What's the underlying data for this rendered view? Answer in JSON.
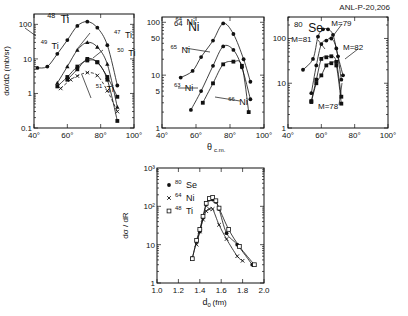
{
  "figure_ref": "ANL-P-20,206",
  "chart_data": [
    {
      "id": "ti",
      "type": "line",
      "scale_y": "log",
      "title": "48Ti",
      "panel_label": {
        "mass": "48",
        "symbol": "Ti"
      },
      "xlabel": "",
      "ylabel": "dσ/dΩ (mb/sr)",
      "xlim": [
        40,
        100
      ],
      "ylim": [
        0.1,
        200
      ],
      "x_ticks": [
        "40°",
        "60°",
        "80°",
        "100°"
      ],
      "y_ticks": [
        "100",
        "10",
        "1",
        "0.1"
      ],
      "series": [
        {
          "name": "48Ti",
          "marker": "filled-circle",
          "x": [
            42,
            48,
            54,
            60,
            66,
            72,
            78,
            84,
            90
          ],
          "y": [
            5.5,
            6,
            14,
            35,
            90,
            120,
            80,
            25,
            1.7
          ]
        },
        {
          "name": "49Ti",
          "marker": "filled-triangle",
          "x": [
            54,
            60,
            66,
            72,
            78,
            84,
            90
          ],
          "y": [
            2,
            6,
            18,
            30,
            22,
            7,
            0.4
          ]
        },
        {
          "name": "47Ti",
          "marker": "filled-square",
          "x": [
            54,
            60,
            66,
            72,
            78,
            84,
            90
          ],
          "y": [
            1.6,
            3,
            6,
            9,
            8,
            2.5,
            0.16
          ]
        },
        {
          "name": "50Ti",
          "marker": "filled-square",
          "x": [
            60,
            66,
            72,
            78,
            84,
            90
          ],
          "y": [
            2.5,
            5,
            10,
            8,
            3,
            0.8
          ]
        },
        {
          "name": "51Ti",
          "marker": "cross",
          "x": [
            56,
            62,
            66,
            72,
            78,
            84,
            90
          ],
          "y": [
            1.4,
            2.5,
            3.2,
            4,
            3.3,
            1.2,
            0.3
          ]
        }
      ],
      "annotations": [
        {
          "text": "48",
          "sub": "Ti",
          "at": [
            48,
            110
          ]
        },
        {
          "text": "49",
          "sub": "Ti",
          "at": [
            44,
            20
          ]
        },
        {
          "text": "47",
          "sub": "Ti",
          "at": [
            88,
            40
          ]
        },
        {
          "text": "50",
          "sub": "Ti",
          "at": [
            90,
            12
          ]
        },
        {
          "text": "51",
          "sub": "Ti",
          "at": [
            77,
            1.1
          ]
        }
      ]
    },
    {
      "id": "ni",
      "type": "line",
      "scale_y": "log",
      "title": "64Ni",
      "panel_label": {
        "mass": "64",
        "symbol": "Ni"
      },
      "xlabel": "θc.m.",
      "ylabel": "",
      "xlim": [
        40,
        100
      ],
      "ylim": [
        1,
        120
      ],
      "x_ticks": [
        "40°",
        "60°",
        "80°",
        "100°"
      ],
      "y_ticks": [
        "100",
        "50",
        "10",
        "5",
        "1"
      ],
      "series": [
        {
          "name": "64Ni",
          "marker": "filled-circle",
          "x": [
            51,
            58,
            63,
            70,
            76,
            82,
            88,
            92
          ],
          "y": [
            9,
            12,
            22,
            45,
            95,
            60,
            20,
            7.5
          ]
        },
        {
          "name": "65Ni",
          "marker": "filled-circle",
          "x": [
            57,
            63,
            70,
            76,
            82,
            87,
            92
          ],
          "y": [
            2.2,
            5,
            15,
            35,
            30,
            14,
            3.5
          ]
        },
        {
          "name": "66Ni",
          "marker": "filled-square",
          "x": [
            64,
            70,
            76,
            82,
            87,
            91
          ],
          "y": [
            3,
            7,
            16,
            18,
            15,
            2
          ]
        }
      ],
      "annotations": [
        {
          "text": "64",
          "sub": "Ni",
          "at": [
            48,
            90
          ]
        },
        {
          "text": "65",
          "sub": "Ni",
          "at": [
            45,
            26
          ]
        },
        {
          "text": "63",
          "sub": "Ni",
          "at": [
            47,
            5
          ]
        },
        {
          "text": "66",
          "sub": "Ni",
          "at": [
            79,
            2.7
          ]
        }
      ]
    },
    {
      "id": "se",
      "type": "line",
      "scale_y": "log",
      "title": "80Se",
      "panel_label": {
        "mass": "80",
        "symbol": "Se"
      },
      "xlabel": "",
      "ylabel": "",
      "xlim": [
        40,
        100
      ],
      "ylim": [
        1,
        300
      ],
      "x_ticks": [
        "40°",
        "60°",
        "80°",
        "100°"
      ],
      "y_ticks": [
        "100",
        "10",
        "1"
      ],
      "series": [
        {
          "name": "M=81",
          "marker": "filled-circle",
          "x": [
            49,
            55,
            58,
            61,
            64,
            67,
            70,
            73
          ],
          "y": [
            20,
            35,
            110,
            160,
            160,
            120,
            40,
            15
          ]
        },
        {
          "name": "M=79",
          "marker": "filled-circle",
          "x": [
            54,
            57,
            60,
            63,
            66,
            69,
            72
          ],
          "y": [
            6,
            25,
            75,
            90,
            100,
            60,
            12
          ]
        },
        {
          "name": "M=82",
          "marker": "filled-square",
          "x": [
            54,
            57,
            60,
            63,
            66,
            69,
            72
          ],
          "y": [
            4,
            12,
            35,
            38,
            40,
            30,
            5
          ]
        },
        {
          "name": "M=78",
          "marker": "filled-square",
          "x": [
            54,
            57,
            60,
            63,
            66,
            69,
            72
          ],
          "y": [
            3.8,
            10,
            15,
            25,
            28,
            25,
            3.5
          ]
        }
      ],
      "annotations": [
        {
          "text": "M=81",
          "at": [
            42,
            85
          ]
        },
        {
          "text": "M=79",
          "at": [
            66,
            190
          ]
        },
        {
          "text": "M=82",
          "at": [
            73,
            55
          ]
        },
        {
          "text": "M=78",
          "at": [
            58,
            2.6
          ]
        }
      ]
    },
    {
      "id": "dr",
      "type": "line",
      "scale_y": "log",
      "title": "",
      "xlabel": "d0 (fm)",
      "ylabel": "dσ / dR",
      "xlim": [
        1.0,
        2.0
      ],
      "ylim": [
        1,
        1000
      ],
      "x_ticks": [
        "1.0",
        "1.2",
        "1.4",
        "1.6",
        "1.8",
        "2.0"
      ],
      "y_ticks": [
        "10³",
        "10²",
        "10",
        "1"
      ],
      "legend": [
        {
          "marker": "filled-circle",
          "mass": "80",
          "symbol": "Se"
        },
        {
          "marker": "cross",
          "mass": "64",
          "symbol": "Ni"
        },
        {
          "marker": "open-square",
          "mass": "48",
          "symbol": "Ti"
        }
      ],
      "legend_position": "upper-left",
      "series": [
        {
          "name": "80Se",
          "marker": "filled-circle",
          "x": [
            1.33,
            1.37,
            1.4,
            1.43,
            1.46,
            1.49,
            1.52,
            1.55,
            1.58,
            1.65,
            1.75,
            1.89
          ],
          "y": [
            4.5,
            12,
            22,
            50,
            110,
            150,
            150,
            130,
            85,
            20,
            10,
            3
          ]
        },
        {
          "name": "64Ni",
          "marker": "cross",
          "x": [
            1.37,
            1.4,
            1.43,
            1.46,
            1.49,
            1.52,
            1.58,
            1.65,
            1.75,
            1.8
          ],
          "y": [
            10,
            22,
            45,
            75,
            85,
            85,
            33,
            14,
            5,
            3.8
          ]
        },
        {
          "name": "48Ti",
          "marker": "open-square",
          "x": [
            1.33,
            1.37,
            1.4,
            1.43,
            1.46,
            1.49,
            1.52,
            1.55,
            1.58,
            1.67,
            1.77,
            1.91
          ],
          "y": [
            4.3,
            13,
            25,
            55,
            120,
            160,
            170,
            140,
            90,
            25,
            9,
            3
          ]
        }
      ]
    }
  ]
}
